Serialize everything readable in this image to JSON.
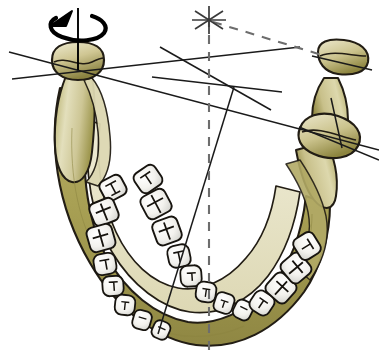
{
  "figure": {
    "title": "Mandible superior view with rotation axis and condylar reference lines",
    "view": "superior (occlusal) oblique view",
    "width": 379,
    "height": 353,
    "background_color": "#ffffff"
  },
  "colors": {
    "bone_light": "#e8e4c4",
    "bone_mid": "#cfc894",
    "bone_dark": "#a8a054",
    "bone_shadow": "#8e8742",
    "outline": "#221d14",
    "tooth_fill": "#f6f5f1",
    "tooth_shadow": "#d8d8d4",
    "tooth_outline": "#17140f",
    "line_solid": "#1a1a1a",
    "line_dashed": "#6d6d6d",
    "arrow": "#000000"
  },
  "annotations": {
    "rotation_arrow": {
      "name": "rotation-arrow",
      "description": "counterclockwise rotation arrow around vertical axis of left condyle",
      "center_x": 76,
      "center_y": 26,
      "rx": 27,
      "ry": 11
    },
    "vertical_axis_left_condyle": {
      "name": "left-condyle-vertical-axis",
      "x": 78,
      "y1": 8,
      "y2": 70
    },
    "star_marker": {
      "name": "star-marker",
      "x": 209,
      "y": 20,
      "radius": 17,
      "spokes": 3
    },
    "midline_dashed": {
      "name": "sagittal-midline",
      "x1": 209,
      "y1": 18,
      "x2": 209,
      "y2": 351,
      "dash": "9 8"
    },
    "dashed_diagonal": {
      "name": "dashed-diagonal-to-right-condyle",
      "x1": 211,
      "y1": 22,
      "x2": 322,
      "y2": 55,
      "dash": "9 8"
    },
    "convergence_point": {
      "name": "line-convergence-point",
      "x": 234,
      "y": 87
    },
    "solid_lines": [
      {
        "name": "condylar-axis-line",
        "x1": 9,
        "y1": 52,
        "x2": 379,
        "y2": 150
      },
      {
        "name": "left-condyle-transverse-line",
        "x1": 12,
        "y1": 79,
        "x2": 300,
        "y2": 47
      },
      {
        "name": "condyle-to-midline-line",
        "x1": 160,
        "y1": 47,
        "x2": 271,
        "y2": 110
      },
      {
        "name": "horizontal-reference-line",
        "x1": 152,
        "y1": 77,
        "x2": 282,
        "y2": 92
      },
      {
        "name": "anterior-oblique-line",
        "x1": 234,
        "y1": 87,
        "x2": 158,
        "y2": 334
      },
      {
        "name": "right-condyle-neck-line",
        "x1": 331,
        "y1": 98,
        "x2": 342,
        "y2": 148
      },
      {
        "name": "coronoid-axis-line",
        "x1": 312,
        "y1": 56,
        "x2": 372,
        "y2": 70
      },
      {
        "name": "right-condyle-axis-line",
        "x1": 299,
        "y1": 127,
        "x2": 379,
        "y2": 160
      }
    ]
  },
  "anatomy": {
    "left_condyle": {
      "name": "left-condyle",
      "cx": 78,
      "cy": 66
    },
    "right_condyle": {
      "name": "right-condyle",
      "cx": 330,
      "cy": 133
    },
    "right_coronoid_process": {
      "name": "right-coronoid-process",
      "cx": 340,
      "cy": 63
    },
    "left_ramus": {
      "name": "left-ramus"
    },
    "right_ramus": {
      "name": "right-ramus"
    },
    "mandibular_body": {
      "name": "mandibular-body"
    },
    "dental_arch": {
      "name": "dental-arch"
    }
  },
  "teeth": {
    "left_row": [
      {
        "id": "L-molar-3",
        "x": 113,
        "y": 188,
        "w": 24,
        "h": 22,
        "rot": -28,
        "pattern": "molar"
      },
      {
        "id": "L-molar-2",
        "x": 104,
        "y": 212,
        "w": 26,
        "h": 24,
        "rot": -22,
        "pattern": "molar"
      },
      {
        "id": "L-molar-1",
        "x": 101,
        "y": 238,
        "w": 26,
        "h": 25,
        "rot": -16,
        "pattern": "molar"
      },
      {
        "id": "L-premolar-2",
        "x": 105,
        "y": 264,
        "w": 22,
        "h": 21,
        "rot": -10,
        "pattern": "premolar"
      },
      {
        "id": "L-premolar-1",
        "x": 113,
        "y": 286,
        "w": 21,
        "h": 20,
        "rot": -4,
        "pattern": "premolar"
      },
      {
        "id": "L-canine",
        "x": 125,
        "y": 305,
        "w": 20,
        "h": 20,
        "rot": 6,
        "pattern": "canine"
      },
      {
        "id": "L-incisor-lat",
        "x": 142,
        "y": 320,
        "w": 18,
        "h": 19,
        "rot": 16,
        "pattern": "incisor"
      },
      {
        "id": "L-incisor-cen",
        "x": 161,
        "y": 330,
        "w": 17,
        "h": 18,
        "rot": 24,
        "pattern": "incisor"
      }
    ],
    "right_row": [
      {
        "id": "R-molar-3",
        "x": 148,
        "y": 179,
        "w": 25,
        "h": 23,
        "rot": -34,
        "pattern": "molar"
      },
      {
        "id": "R-molar-2",
        "x": 156,
        "y": 204,
        "w": 27,
        "h": 25,
        "rot": -28,
        "pattern": "molar"
      },
      {
        "id": "R-molar-1",
        "x": 167,
        "y": 231,
        "w": 26,
        "h": 25,
        "rot": -20,
        "pattern": "molar"
      },
      {
        "id": "R-premolar-2",
        "x": 179,
        "y": 256,
        "w": 22,
        "h": 22,
        "rot": -12,
        "pattern": "premolar"
      },
      {
        "id": "R-premolar-1",
        "x": 191,
        "y": 276,
        "w": 21,
        "h": 21,
        "rot": -4,
        "pattern": "premolar"
      },
      {
        "id": "R-canine",
        "x": 206,
        "y": 292,
        "w": 20,
        "h": 20,
        "rot": 8,
        "pattern": "canine"
      },
      {
        "id": "R-incisor-lat",
        "x": 224,
        "y": 303,
        "w": 19,
        "h": 20,
        "rot": 18,
        "pattern": "incisor"
      },
      {
        "id": "R-incisor-cen",
        "x": 243,
        "y": 310,
        "w": 18,
        "h": 19,
        "rot": 26,
        "pattern": "incisor"
      },
      {
        "id": "R-premolar-post",
        "x": 262,
        "y": 303,
        "w": 22,
        "h": 22,
        "rot": 34,
        "pattern": "premolar"
      },
      {
        "id": "R-molar-post-1",
        "x": 281,
        "y": 288,
        "w": 26,
        "h": 25,
        "rot": 42,
        "pattern": "molar"
      },
      {
        "id": "R-molar-post-2",
        "x": 296,
        "y": 268,
        "w": 26,
        "h": 25,
        "rot": 50,
        "pattern": "molar"
      },
      {
        "id": "R-molar-post-3",
        "x": 307,
        "y": 246,
        "w": 24,
        "h": 23,
        "rot": 58,
        "pattern": "molar"
      }
    ]
  }
}
